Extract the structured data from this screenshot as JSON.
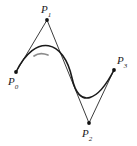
{
  "figure": {
    "type": "cubic-bezier-control-polygon",
    "width": 137,
    "height": 146,
    "background_color": "#ffffff",
    "curve_color": "#1a1a1a",
    "curve_highlight_color": "#8c8c8c",
    "polygon_color": "#262626",
    "point_color": "#111111",
    "curve_width": 1.6,
    "polygon_width": 0.9,
    "point_radius": 1.9
  },
  "points": [
    {
      "id": "P0",
      "name": "P",
      "subscript": "0",
      "x": 16,
      "y": 72,
      "label_x": 8,
      "label_y": 76
    },
    {
      "id": "P1",
      "name": "P",
      "subscript": "1",
      "x": 47,
      "y": 20,
      "label_x": 41,
      "label_y": 4
    },
    {
      "id": "P2",
      "name": "P",
      "subscript": "2",
      "x": 89,
      "y": 123,
      "label_x": 82,
      "label_y": 128
    },
    {
      "id": "P3",
      "name": "P",
      "subscript": "3",
      "x": 114,
      "y": 70,
      "label_x": 117,
      "label_y": 55
    }
  ],
  "control_polygon": {
    "path": "M 16 72 L 47 20 L 89 123 L 114 70",
    "segments": [
      {
        "from": "P0",
        "to": "P1"
      },
      {
        "from": "P1",
        "to": "P2"
      },
      {
        "from": "P2",
        "to": "P3"
      }
    ]
  },
  "bezier_curve": {
    "path": "M 16 72 C 36 32 64 40 72 78 C 79 110 98 101 114 70",
    "start": "P0",
    "end": "P3",
    "control_1": "P1",
    "control_2": "P2",
    "highlight_path": "M 34 56 C 38 53 43 53 48 55"
  }
}
